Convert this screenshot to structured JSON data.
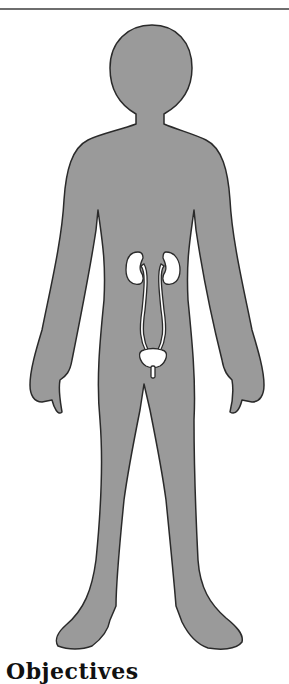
{
  "document": {
    "section_heading": "Objectives",
    "figure": {
      "subject": "human-body-silhouette",
      "organs_shown": [
        "left-kidney",
        "right-kidney",
        "left-ureter",
        "right-ureter",
        "bladder",
        "urethra"
      ],
      "colors": {
        "body_fill": "#9a9a9a",
        "outline": "#2a2a2a",
        "organ_fill": "#ffffff"
      }
    }
  }
}
